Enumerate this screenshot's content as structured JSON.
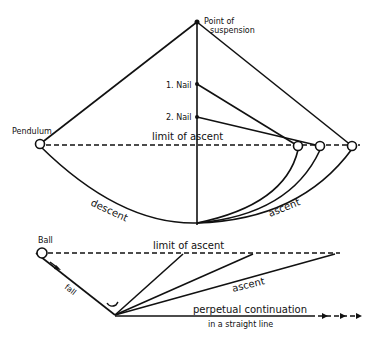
{
  "upper_diagram": {
    "labels": {
      "suspension_line1": "Point of",
      "suspension_line2": "suspension",
      "nail1": "1. Nail",
      "nail2": "2. Nail",
      "pendulum": "Pendulum",
      "limit": "limit of ascent",
      "descent": "descent",
      "ascent": "ascent"
    }
  },
  "lower_diagram": {
    "labels": {
      "ball": "Ball",
      "limit": "limit of ascent",
      "fall": "fall",
      "ascent": "ascent",
      "perpetual_line1": "perpetual continuation",
      "perpetual_line2": "in a straight line"
    }
  },
  "colors": {
    "ink": "#111111",
    "background": "#ffffff"
  }
}
